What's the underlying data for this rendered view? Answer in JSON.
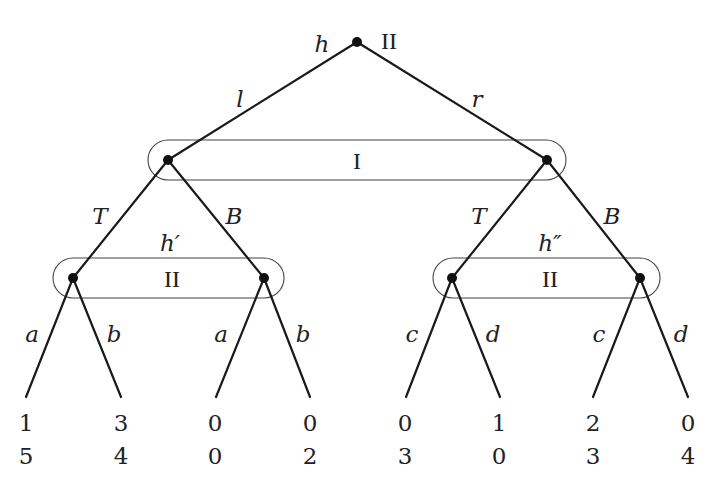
{
  "diagram": {
    "type": "extensive-form game tree",
    "root": {
      "history_label": "h",
      "player": "II",
      "actions": [
        "l",
        "r"
      ]
    },
    "level1": {
      "information_set_player": "I",
      "actions_left": [
        "T",
        "B"
      ],
      "actions_right": [
        "T",
        "B"
      ]
    },
    "level2": {
      "left": {
        "history_label": "h′",
        "information_set_player": "II",
        "actions_node1": [
          "a",
          "b"
        ],
        "actions_node2": [
          "a",
          "b"
        ]
      },
      "right": {
        "history_label": "h″",
        "information_set_player": "II",
        "actions_node1": [
          "c",
          "d"
        ],
        "actions_node2": [
          "c",
          "d"
        ]
      }
    },
    "payoffs": [
      {
        "p1": "1",
        "p2": "5"
      },
      {
        "p1": "3",
        "p2": "4"
      },
      {
        "p1": "0",
        "p2": "0"
      },
      {
        "p1": "0",
        "p2": "2"
      },
      {
        "p1": "0",
        "p2": "3"
      },
      {
        "p1": "1",
        "p2": "0"
      },
      {
        "p1": "2",
        "p2": "3"
      },
      {
        "p1": "0",
        "p2": "4"
      }
    ]
  }
}
